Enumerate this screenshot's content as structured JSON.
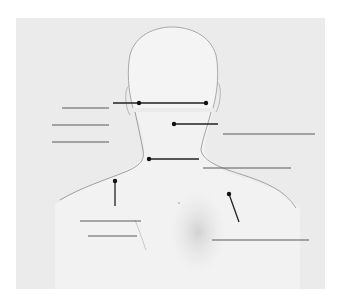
{
  "diagram": {
    "title": "",
    "colors": {
      "page_bg": "#ffffff",
      "panel_bg": "#ebebeb",
      "body_fill": "#f4f4f4",
      "outline": "#a9a9a9",
      "pointer": "#222222",
      "label_line": "#555555",
      "shading": "#d6d6d6"
    },
    "pointers": [
      {
        "id": "p1",
        "x1": 113,
        "y1": 103,
        "x2": 207,
        "y2": 103,
        "dots": [
          [
            139,
            103
          ],
          [
            206,
            103
          ]
        ]
      },
      {
        "id": "p2",
        "x1": 174,
        "y1": 124,
        "x2": 218,
        "y2": 124,
        "dots": [
          [
            174,
            124
          ]
        ]
      },
      {
        "id": "p3",
        "x1": 149,
        "y1": 159,
        "x2": 199,
        "y2": 159,
        "dots": [
          [
            149,
            159
          ]
        ]
      },
      {
        "id": "p4",
        "x1": 115,
        "y1": 181,
        "x2": 115,
        "y2": 206,
        "dots": [
          [
            115,
            181
          ]
        ]
      },
      {
        "id": "p5",
        "x1": 229,
        "y1": 194,
        "x2": 239,
        "y2": 222,
        "dots": [
          [
            229,
            194
          ]
        ]
      }
    ],
    "label_blanks": [
      {
        "id": "blank-1",
        "x1": 62,
        "x2": 109,
        "y": 108,
        "text": ""
      },
      {
        "id": "blank-2",
        "x1": 52,
        "x2": 109,
        "y": 125,
        "text": ""
      },
      {
        "id": "blank-3",
        "x1": 52,
        "x2": 109,
        "y": 142,
        "text": ""
      },
      {
        "id": "blank-4",
        "x1": 223,
        "x2": 315,
        "y": 134,
        "text": ""
      },
      {
        "id": "blank-5",
        "x1": 203,
        "x2": 291,
        "y": 168,
        "text": ""
      },
      {
        "id": "blank-6",
        "x1": 80,
        "x2": 141,
        "y": 221,
        "text": ""
      },
      {
        "id": "blank-7",
        "x1": 88,
        "x2": 137,
        "y": 236,
        "text": ""
      },
      {
        "id": "blank-8",
        "x1": 212,
        "x2": 309,
        "y": 240,
        "text": ""
      }
    ]
  }
}
